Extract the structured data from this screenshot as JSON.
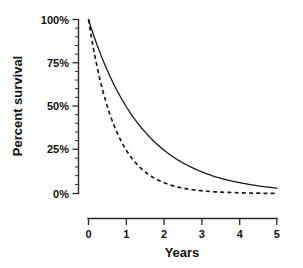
{
  "chart_data": {
    "type": "line",
    "title": "",
    "xlabel": "Years",
    "ylabel": "Percent survival",
    "xlim": [
      0,
      5
    ],
    "ylim": [
      0,
      100
    ],
    "grid": false,
    "legend": "none",
    "x_ticks": [
      "0",
      "1",
      "2",
      "3",
      "4",
      "5"
    ],
    "x_tick_values": [
      0,
      1,
      2,
      3,
      4,
      5
    ],
    "y_ticks": [
      "0%",
      "25%",
      "50%",
      "75%",
      "100%"
    ],
    "y_tick_values": [
      0,
      25,
      50,
      75,
      100
    ],
    "y_minor_tick_values": [
      5,
      10,
      15,
      20,
      30,
      35,
      40,
      45,
      55,
      60,
      65,
      70,
      80,
      85,
      90,
      95
    ],
    "x": [
      0,
      0.25,
      0.5,
      0.75,
      1,
      1.25,
      1.5,
      1.75,
      2,
      2.25,
      2.5,
      2.75,
      3,
      3.25,
      3.5,
      3.75,
      4,
      4.25,
      4.5,
      4.75,
      5
    ],
    "series": [
      {
        "name": "solid-curve",
        "style": "solid",
        "color": "#1a1a1a",
        "values": [
          100,
          84.1,
          70.7,
          59.5,
          50,
          42.0,
          35.4,
          29.7,
          25,
          21.0,
          17.7,
          14.9,
          12.5,
          10.5,
          8.8,
          7.4,
          6.3,
          5.3,
          4.4,
          3.7,
          3.1
        ]
      },
      {
        "name": "dashed-curve",
        "style": "dashed",
        "color": "#1a1a1a",
        "values": [
          100,
          70.7,
          50,
          35.4,
          25,
          17.7,
          12.5,
          8.8,
          6.3,
          4.4,
          3.1,
          2.2,
          1.6,
          1.1,
          0.8,
          0.6,
          0.4,
          0.3,
          0.2,
          0.1,
          0.1
        ]
      }
    ]
  },
  "axes": {
    "x_axis_label": "Years",
    "y_axis_label": "Percent survival",
    "x_tick_labels": [
      "0",
      "1",
      "2",
      "3",
      "4",
      "5"
    ],
    "y_tick_labels": [
      "100%",
      "75%",
      "50%",
      "25%",
      "0%"
    ]
  },
  "colors": {
    "background": "#ffffff",
    "ink": "#1a1a1a",
    "axis": "#2b2b2b"
  }
}
